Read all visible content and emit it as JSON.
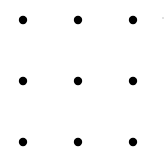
{
  "diagram": {
    "type": "dot-grid",
    "rows": 3,
    "columns": 3,
    "background": "#ffffff",
    "dot_color": "#000000",
    "dot_radius": 4.2,
    "column_x": [
      23,
      78,
      133
    ],
    "row_y": [
      20,
      81,
      142
    ],
    "dots": [
      {
        "row": 0,
        "col": 0
      },
      {
        "row": 0,
        "col": 1
      },
      {
        "row": 0,
        "col": 2
      },
      {
        "row": 1,
        "col": 0
      },
      {
        "row": 1,
        "col": 1
      },
      {
        "row": 1,
        "col": 2
      },
      {
        "row": 2,
        "col": 0
      },
      {
        "row": 2,
        "col": 1
      },
      {
        "row": 2,
        "col": 2
      }
    ],
    "artifact_speck": {
      "x": 163,
      "y": 18,
      "color": "#bbbbbb",
      "radius": 0.8
    }
  }
}
